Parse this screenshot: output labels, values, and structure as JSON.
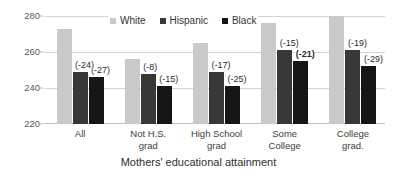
{
  "chart_data": {
    "type": "bar",
    "title": "",
    "xlabel": "Mothers' educational attainment",
    "ylabel": "",
    "ylim": [
      220,
      280
    ],
    "yticks": [
      220,
      240,
      260,
      280
    ],
    "grid": true,
    "legend_position": "top-center",
    "categories": [
      "All",
      "Not H.S. grad",
      "High School grad",
      "Some College",
      "College grad."
    ],
    "category_lines": [
      [
        "All"
      ],
      [
        "Not H.S.",
        "grad"
      ],
      [
        "High School",
        "grad"
      ],
      [
        "Some",
        "College"
      ],
      [
        "College",
        "grad."
      ]
    ],
    "series": [
      {
        "name": "White",
        "color": "#c9c9c9",
        "values": [
          273,
          256,
          265,
          276,
          280
        ],
        "labels": [
          "",
          "",
          "",
          "",
          ""
        ]
      },
      {
        "name": "Hispanic",
        "color": "#383838",
        "values": [
          249,
          248,
          249,
          261,
          261
        ],
        "labels": [
          "(-24)",
          "(-8)",
          "(-17)",
          "(-15)",
          "(-19)"
        ],
        "labels_bold": [
          false,
          false,
          false,
          false,
          false
        ]
      },
      {
        "name": "Black",
        "color": "#161616",
        "values": [
          246,
          241,
          241,
          255,
          252
        ],
        "labels": [
          "(-27)",
          "(-15)",
          "(-25)",
          "(-21)",
          "(-29)"
        ],
        "labels_bold": [
          false,
          false,
          false,
          true,
          false
        ]
      }
    ]
  },
  "axis": {
    "y_tick_labels": [
      "280",
      "260",
      "240",
      "220"
    ],
    "x_title": "Mothers' educational attainment"
  },
  "legend": {
    "items": [
      {
        "label": "White",
        "color": "#c9c9c9"
      },
      {
        "label": "Hispanic",
        "color": "#383838"
      },
      {
        "label": "Black",
        "color": "#161616"
      }
    ]
  }
}
